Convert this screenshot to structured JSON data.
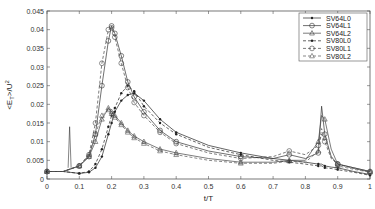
{
  "chart_data": {
    "type": "line",
    "title": "",
    "xlabel": "t/T",
    "ylabel": "<E_T>/U^2",
    "xlim": [
      0,
      1
    ],
    "ylim": [
      0,
      0.045
    ],
    "xticks": [
      "0",
      "0.1",
      "0.2",
      "0.3",
      "0.4",
      "0.5",
      "0.6",
      "0.7",
      "0.8",
      "0.9",
      "1"
    ],
    "yticks": [
      "0",
      "0.005",
      "0.01",
      "0.015",
      "0.02",
      "0.025",
      "0.03",
      "0.035",
      "0.04",
      "0.045"
    ],
    "grid": false,
    "legend_position": "upper right",
    "x": [
      0,
      0.05,
      0.1,
      0.13,
      0.15,
      0.17,
      0.19,
      0.2,
      0.21,
      0.23,
      0.25,
      0.27,
      0.3,
      0.35,
      0.4,
      0.5,
      0.6,
      0.7,
      0.75,
      0.8,
      0.84,
      0.85,
      0.86,
      0.88,
      0.9,
      0.95,
      1.0
    ],
    "series": [
      {
        "name": "SV64L0",
        "style": "solid",
        "marker": "dot",
        "values": [
          0.002,
          0.002,
          0.0015,
          0.0018,
          0.003,
          0.006,
          0.012,
          0.015,
          0.018,
          0.021,
          0.0225,
          0.023,
          0.021,
          0.016,
          0.0125,
          0.009,
          0.007,
          0.0055,
          0.005,
          0.0045,
          0.004,
          0.004,
          0.0035,
          0.0032,
          0.003,
          0.002,
          0.0012
        ]
      },
      {
        "name": "SV64L1",
        "style": "solid",
        "marker": "circle",
        "values": [
          0.002,
          0.002,
          0.0035,
          0.006,
          0.012,
          0.025,
          0.037,
          0.041,
          0.039,
          0.033,
          0.026,
          0.022,
          0.018,
          0.013,
          0.01,
          0.0075,
          0.006,
          0.0055,
          0.0065,
          0.0055,
          0.007,
          0.0195,
          0.012,
          0.006,
          0.004,
          0.003,
          0.002
        ]
      },
      {
        "name": "SV64L2",
        "style": "solid",
        "marker": "triangle",
        "values": [
          0.002,
          0.002,
          0.0035,
          0.006,
          0.01,
          0.016,
          0.019,
          0.018,
          0.017,
          0.015,
          0.013,
          0.0115,
          0.01,
          0.008,
          0.007,
          0.0055,
          0.0045,
          0.0045,
          0.005,
          0.005,
          0.01,
          0.017,
          0.016,
          0.008,
          0.004,
          0.003,
          0.002
        ]
      },
      {
        "name": "SV80L0",
        "style": "dashed",
        "marker": "dot",
        "values": [
          0.002,
          0.002,
          0.0015,
          0.002,
          0.004,
          0.008,
          0.014,
          0.017,
          0.019,
          0.023,
          0.025,
          0.0235,
          0.0195,
          0.015,
          0.012,
          0.0085,
          0.0065,
          0.005,
          0.0045,
          0.004,
          0.0035,
          0.0035,
          0.003,
          0.0028,
          0.0025,
          0.0018,
          0.001
        ]
      },
      {
        "name": "SV80L1",
        "style": "dashed",
        "marker": "circle",
        "values": [
          0.002,
          0.002,
          0.0035,
          0.0065,
          0.015,
          0.031,
          0.04,
          0.0405,
          0.038,
          0.031,
          0.0245,
          0.0205,
          0.017,
          0.0125,
          0.0095,
          0.007,
          0.0055,
          0.006,
          0.0075,
          0.0065,
          0.009,
          0.012,
          0.01,
          0.0055,
          0.004,
          0.0028,
          0.0018
        ]
      },
      {
        "name": "SV80L2",
        "style": "dashed",
        "marker": "triangle",
        "values": [
          0.002,
          0.002,
          0.0035,
          0.0065,
          0.012,
          0.017,
          0.0185,
          0.0175,
          0.0165,
          0.0145,
          0.0125,
          0.011,
          0.0095,
          0.0075,
          0.0065,
          0.005,
          0.0042,
          0.0042,
          0.0048,
          0.0045,
          0.0075,
          0.0135,
          0.011,
          0.006,
          0.0035,
          0.0026,
          0.0018
        ]
      }
    ],
    "annotations": [
      {
        "note": "narrow spike near t/T=0.07 reaching ~0.014"
      }
    ]
  }
}
